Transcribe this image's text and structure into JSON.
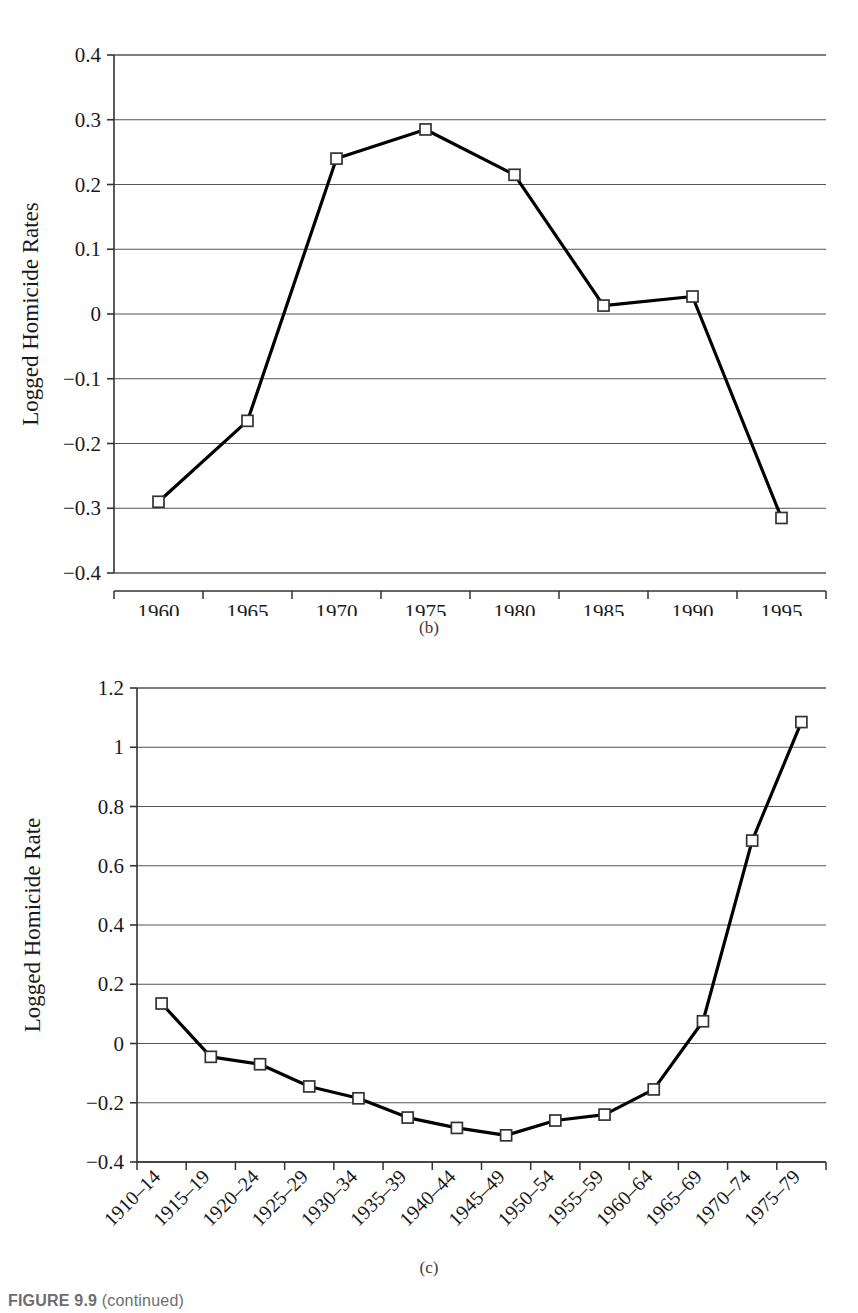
{
  "figure": {
    "caption_label": "FIGURE 9.9",
    "caption_text": "(continued)"
  },
  "panel_b": {
    "caption": "(b)",
    "chart_data": {
      "type": "line",
      "title": "",
      "xlabel": "",
      "ylabel": "Logged Homicide Rates",
      "categories": [
        "1960",
        "1965",
        "1970",
        "1975",
        "1980",
        "1985",
        "1990",
        "1995"
      ],
      "values": [
        -0.29,
        -0.165,
        0.24,
        0.285,
        0.215,
        0.013,
        0.027,
        -0.315
      ],
      "ylim": [
        -0.4,
        0.4
      ],
      "yticks": [
        -0.4,
        -0.3,
        -0.2,
        -0.1,
        0,
        0.1,
        0.2,
        0.3,
        0.4
      ],
      "ytick_labels": [
        "−0.4",
        "−0.3",
        "−0.2",
        "−0.1",
        "0",
        "0.1",
        "0.2",
        "0.3",
        "0.4"
      ],
      "grid": true,
      "legend": "none",
      "marker": "open-square",
      "line_color": "#000000",
      "grid_color": "#555555"
    }
  },
  "panel_c": {
    "caption": "(c)",
    "chart_data": {
      "type": "line",
      "title": "",
      "xlabel": "",
      "ylabel": "Logged Homicide Rate",
      "categories": [
        "1910–14",
        "1915–19",
        "1920–24",
        "1925–29",
        "1930–34",
        "1935–39",
        "1940–44",
        "1945–49",
        "1950–54",
        "1955–59",
        "1960–64",
        "1965–69",
        "1970–74",
        "1975–79"
      ],
      "values": [
        0.135,
        -0.045,
        -0.07,
        -0.145,
        -0.185,
        -0.25,
        -0.285,
        -0.31,
        -0.26,
        -0.24,
        -0.155,
        0.075,
        0.685,
        1.085
      ],
      "ylim": [
        -0.4,
        1.2
      ],
      "yticks": [
        -0.4,
        -0.2,
        0,
        0.2,
        0.4,
        0.6,
        0.8,
        1.0,
        1.2
      ],
      "ytick_labels": [
        "−0.4",
        "−0.2",
        "0",
        "0.2",
        "0.4",
        "0.6",
        "0.8",
        "1",
        "1.2"
      ],
      "grid": true,
      "legend": "none",
      "marker": "open-square",
      "line_color": "#000000",
      "grid_color": "#555555",
      "xtick_label_rotation": 45
    }
  }
}
